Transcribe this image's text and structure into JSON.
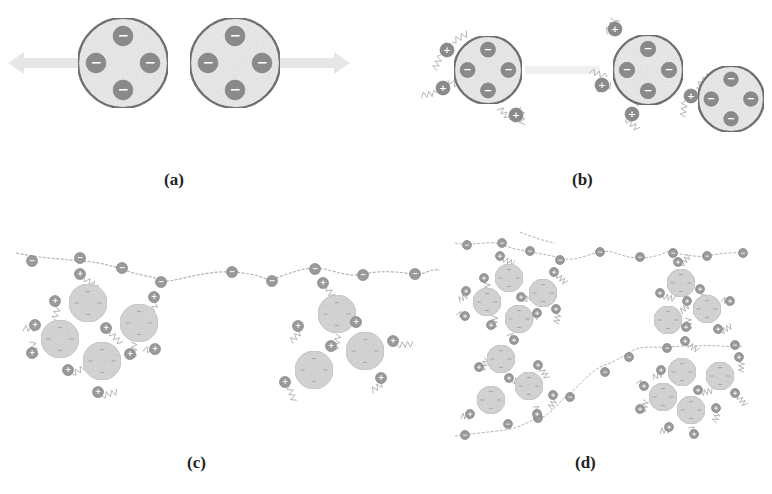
{
  "figure": {
    "panels": [
      {
        "id": "a",
        "label": "(a)",
        "label_x": 164,
        "label_y": 170
      },
      {
        "id": "b",
        "label": "(b)",
        "label_x": 572,
        "label_y": 170
      },
      {
        "id": "c",
        "label": "(c)",
        "label_x": 187,
        "label_y": 453
      },
      {
        "id": "d",
        "label": "(d)",
        "label_x": 575,
        "label_y": 453
      }
    ],
    "colors": {
      "particle_fill": "#ececec",
      "particle_border": "#555555",
      "charge_fill": "#8a8a8a",
      "charge_symbol": "#ffffff",
      "floc_fill": "#d6d6d6",
      "small_charge_fill": "#9a9a9a",
      "chain": "#b5b5b5",
      "arrow": "#e6e6e6"
    },
    "symbols": {
      "negative": "−",
      "positive": "+"
    },
    "panel_a": {
      "particles": [
        {
          "cx": 123,
          "cy": 63,
          "r": 45
        },
        {
          "cx": 235,
          "cy": 63,
          "r": 45
        }
      ],
      "arrows": [
        {
          "x1": 78,
          "x2": 8,
          "y": 63
        },
        {
          "x1": 280,
          "x2": 350,
          "y": 63
        }
      ]
    },
    "panel_b": {
      "particles": [
        {
          "cx": 488,
          "cy": 70,
          "r": 34
        },
        {
          "cx": 648,
          "cy": 70,
          "r": 35
        },
        {
          "cx": 731,
          "cy": 99,
          "r": 33
        }
      ],
      "cations": [
        {
          "x": 447,
          "y": 50
        },
        {
          "x": 443,
          "y": 88
        },
        {
          "x": 516,
          "y": 115
        },
        {
          "x": 615,
          "y": 29
        },
        {
          "x": 602,
          "y": 85
        },
        {
          "x": 632,
          "y": 114
        },
        {
          "x": 691,
          "y": 96
        }
      ]
    },
    "panel_c": {
      "chain": "M16,253 C60,262 90,258 118,268 S150,275 160,280 S200,270 232,272 S268,282 272,280 S300,268 315,268 S345,278 363,274 S400,272 412,274 S430,268 440,270",
      "chain_charges": [
        {
          "x": 32,
          "y": 261
        },
        {
          "x": 80,
          "y": 258
        },
        {
          "x": 122,
          "y": 268
        },
        {
          "x": 161,
          "y": 282
        },
        {
          "x": 232,
          "y": 272
        },
        {
          "x": 272,
          "y": 281
        },
        {
          "x": 315,
          "y": 269
        },
        {
          "x": 363,
          "y": 275
        },
        {
          "x": 415,
          "y": 274
        }
      ],
      "flocs": [
        {
          "cx": 88,
          "cy": 303,
          "r": 19
        },
        {
          "cx": 60,
          "cy": 339,
          "r": 19
        },
        {
          "cx": 139,
          "cy": 323,
          "r": 19
        },
        {
          "cx": 102,
          "cy": 361,
          "r": 19
        },
        {
          "cx": 337,
          "cy": 314,
          "r": 19
        },
        {
          "cx": 365,
          "cy": 351,
          "r": 19
        },
        {
          "cx": 314,
          "cy": 370,
          "r": 19
        }
      ],
      "cations": [
        {
          "x": 80,
          "y": 274
        },
        {
          "x": 55,
          "y": 301
        },
        {
          "x": 35,
          "y": 325
        },
        {
          "x": 32,
          "y": 353
        },
        {
          "x": 68,
          "y": 370
        },
        {
          "x": 106,
          "y": 328
        },
        {
          "x": 154,
          "y": 297
        },
        {
          "x": 155,
          "y": 349
        },
        {
          "x": 130,
          "y": 354
        },
        {
          "x": 98,
          "y": 392
        },
        {
          "x": 323,
          "y": 283
        },
        {
          "x": 298,
          "y": 326
        },
        {
          "x": 356,
          "y": 322
        },
        {
          "x": 331,
          "y": 346
        },
        {
          "x": 393,
          "y": 341
        },
        {
          "x": 285,
          "y": 382
        },
        {
          "x": 381,
          "y": 378
        }
      ]
    },
    "panel_d": {
      "chains": [
        "M455,243 C470,247 490,240 500,244 S520,250 530,252 S545,254 560,258 S585,255 600,252 S620,258 640,258 S665,250 672,252 S700,258 708,256 S730,252 745,253",
        "M455,436 C470,434 490,432 505,430 S530,420 540,418 S560,400 570,393 S590,370 605,365 S630,350 640,348 S660,348 670,347 S700,345 720,346 S735,348 742,346",
        "M520,232 C530,236 540,240 555,243"
      ],
      "chain_charges": [
        {
          "x": 467,
          "y": 245
        },
        {
          "x": 502,
          "y": 243
        },
        {
          "x": 530,
          "y": 251
        },
        {
          "x": 560,
          "y": 260
        },
        {
          "x": 600,
          "y": 252
        },
        {
          "x": 640,
          "y": 257
        },
        {
          "x": 673,
          "y": 253
        },
        {
          "x": 707,
          "y": 256
        },
        {
          "x": 743,
          "y": 253
        },
        {
          "x": 465,
          "y": 435
        },
        {
          "x": 508,
          "y": 424
        },
        {
          "x": 538,
          "y": 418
        },
        {
          "x": 570,
          "y": 397
        },
        {
          "x": 605,
          "y": 372
        },
        {
          "x": 629,
          "y": 357
        },
        {
          "x": 667,
          "y": 348
        },
        {
          "x": 735,
          "y": 345
        }
      ],
      "flocs": [
        {
          "cx": 509,
          "cy": 278,
          "r": 14
        },
        {
          "cx": 487,
          "cy": 302,
          "r": 14
        },
        {
          "cx": 543,
          "cy": 293,
          "r": 14
        },
        {
          "cx": 519,
          "cy": 319,
          "r": 14
        },
        {
          "cx": 501,
          "cy": 359,
          "r": 14
        },
        {
          "cx": 529,
          "cy": 386,
          "r": 14
        },
        {
          "cx": 491,
          "cy": 400,
          "r": 14
        },
        {
          "cx": 681,
          "cy": 283,
          "r": 14
        },
        {
          "cx": 707,
          "cy": 309,
          "r": 14
        },
        {
          "cx": 668,
          "cy": 320,
          "r": 14
        },
        {
          "cx": 682,
          "cy": 372,
          "r": 14
        },
        {
          "cx": 720,
          "cy": 376,
          "r": 14
        },
        {
          "cx": 663,
          "cy": 397,
          "r": 14
        },
        {
          "cx": 691,
          "cy": 410,
          "r": 14
        }
      ],
      "cations": [
        {
          "x": 500,
          "y": 256
        },
        {
          "x": 484,
          "y": 278
        },
        {
          "x": 466,
          "y": 291
        },
        {
          "x": 465,
          "y": 316
        },
        {
          "x": 491,
          "y": 325
        },
        {
          "x": 521,
          "y": 297
        },
        {
          "x": 554,
          "y": 272
        },
        {
          "x": 556,
          "y": 309
        },
        {
          "x": 537,
          "y": 313
        },
        {
          "x": 514,
          "y": 340
        },
        {
          "x": 479,
          "y": 367
        },
        {
          "x": 509,
          "y": 378
        },
        {
          "x": 538,
          "y": 365
        },
        {
          "x": 553,
          "y": 395
        },
        {
          "x": 470,
          "y": 414
        },
        {
          "x": 537,
          "y": 414
        },
        {
          "x": 678,
          "y": 262
        },
        {
          "x": 660,
          "y": 293
        },
        {
          "x": 700,
          "y": 289
        },
        {
          "x": 687,
          "y": 301
        },
        {
          "x": 730,
          "y": 301
        },
        {
          "x": 686,
          "y": 327
        },
        {
          "x": 718,
          "y": 329
        },
        {
          "x": 685,
          "y": 341
        },
        {
          "x": 739,
          "y": 357
        },
        {
          "x": 661,
          "y": 370
        },
        {
          "x": 644,
          "y": 386
        },
        {
          "x": 640,
          "y": 409
        },
        {
          "x": 698,
          "y": 390
        },
        {
          "x": 735,
          "y": 393
        },
        {
          "x": 716,
          "y": 408
        },
        {
          "x": 669,
          "y": 427
        },
        {
          "x": 694,
          "y": 434
        }
      ]
    }
  }
}
